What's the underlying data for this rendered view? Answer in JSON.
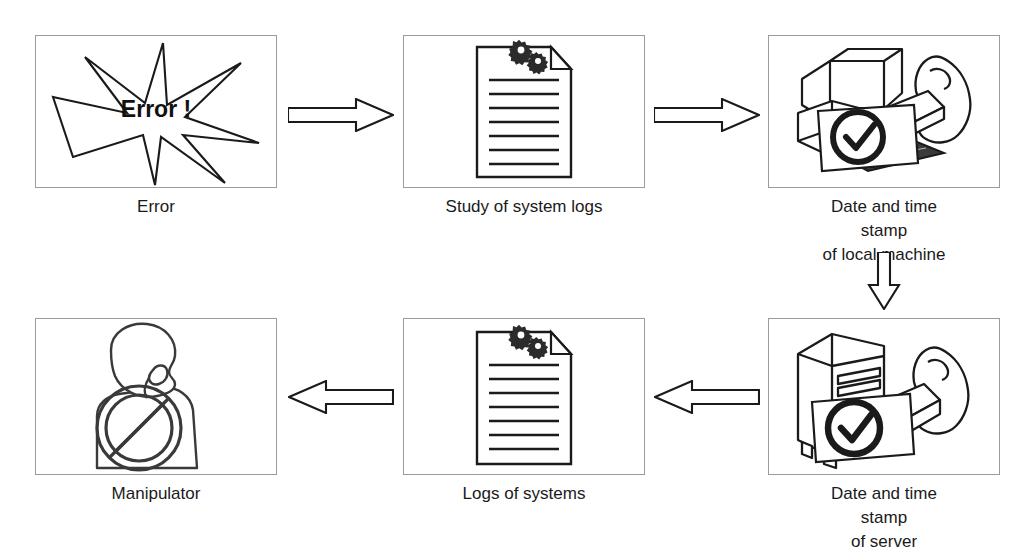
{
  "diagram": {
    "background": "#ffffff",
    "line_color": "#1a1a1a",
    "box_border_color": "#9b9b9b",
    "label_color": "#1a1a1a",
    "nodes": [
      {
        "id": "error",
        "label": "Error",
        "icon": "explosion-star-icon",
        "inner_text": "Error !",
        "x": 35,
        "y": 35,
        "w": 242,
        "h": 153,
        "label_y": 195
      },
      {
        "id": "study-of-system-logs",
        "label": "Study of system logs",
        "icon": "document-with-gears-icon",
        "x": 403,
        "y": 35,
        "w": 242,
        "h": 153,
        "label_y": 195
      },
      {
        "id": "date-time-stamp-local-machine",
        "label": "Date and time stamp\nof local machine",
        "icon": "desktop-computer-stamp-icon",
        "x": 768,
        "y": 35,
        "w": 232,
        "h": 153,
        "label_y": 195
      },
      {
        "id": "date-time-stamp-server",
        "label": "Date and time stamp\nof server",
        "icon": "server-stamp-icon",
        "x": 768,
        "y": 318,
        "w": 232,
        "h": 157,
        "label_y": 482
      },
      {
        "id": "logs-of-systems",
        "label": "Logs of systems",
        "icon": "document-with-gears-icon",
        "x": 403,
        "y": 318,
        "w": 242,
        "h": 157,
        "label_y": 482
      },
      {
        "id": "manipulator",
        "label": "Manipulator",
        "icon": "person-prohibited-icon",
        "x": 35,
        "y": 318,
        "w": 242,
        "h": 157,
        "label_y": 482
      }
    ],
    "arrows": [
      {
        "id": "error-to-study",
        "direction": "right",
        "x": 288,
        "y": 98,
        "w": 106,
        "h": 34
      },
      {
        "id": "study-to-local-stamp",
        "direction": "right",
        "x": 654,
        "y": 98,
        "w": 106,
        "h": 34
      },
      {
        "id": "local-stamp-to-server-stamp",
        "direction": "down",
        "x": 867,
        "y": 252,
        "w": 34,
        "h": 58
      },
      {
        "id": "server-stamp-to-logs",
        "direction": "left",
        "x": 654,
        "y": 380,
        "w": 106,
        "h": 34
      },
      {
        "id": "logs-to-manipulator",
        "direction": "left",
        "x": 288,
        "y": 380,
        "w": 106,
        "h": 34
      }
    ]
  }
}
